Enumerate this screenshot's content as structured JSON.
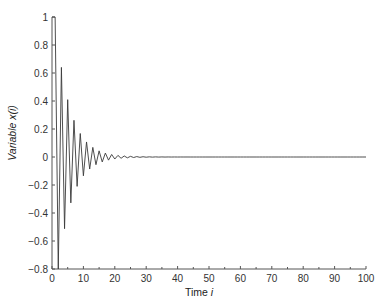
{
  "chart_data": {
    "type": "line",
    "title": "",
    "xlabel": "Time",
    "xlabel_italic": "i",
    "ylabel": "Variable x(",
    "ylabel_italic": "i",
    "ylabel_suffix": ")",
    "xlim": [
      0,
      100
    ],
    "ylim": [
      -0.8,
      1
    ],
    "xticks": [
      0,
      10,
      20,
      30,
      40,
      50,
      60,
      70,
      80,
      90,
      100
    ],
    "xtick_labels": [
      "0",
      "10",
      "20",
      "30",
      "40",
      "50",
      "60",
      "70",
      "80",
      "90",
      "100"
    ],
    "xminor_step": 5,
    "yticks": [
      -0.8,
      -0.6,
      -0.4,
      -0.2,
      0,
      0.2,
      0.4,
      0.6,
      0.8,
      1
    ],
    "ytick_labels": [
      "−0.8",
      "−0.6",
      "−0.4",
      "−0.2",
      "0",
      "0.2",
      "0.4",
      "0.6",
      "0.8",
      "1"
    ],
    "grid": false,
    "legend": "none",
    "series": [
      {
        "name": "x(i)",
        "description": "Damped alternating sequence: x(0)=1, x(i)=(-0.8)^(i-1) for i>=1",
        "x": [
          0,
          1,
          2,
          3,
          4,
          5,
          6,
          7,
          8,
          9,
          10,
          11,
          12,
          13,
          14,
          15,
          16,
          17,
          18,
          19,
          20,
          21,
          22,
          23,
          24,
          25,
          26,
          27,
          28,
          29,
          30,
          31,
          32,
          33,
          34,
          35,
          36,
          37,
          38,
          39,
          40,
          41,
          42,
          43,
          44,
          45,
          46,
          47,
          48,
          49,
          50,
          51,
          52,
          53,
          54,
          55,
          56,
          57,
          58,
          59,
          60,
          61,
          62,
          63,
          64,
          65,
          66,
          67,
          68,
          69,
          70,
          71,
          72,
          73,
          74,
          75,
          76,
          77,
          78,
          79,
          80,
          81,
          82,
          83,
          84,
          85,
          86,
          87,
          88,
          89,
          90,
          91,
          92,
          93,
          94,
          95,
          96,
          97,
          98,
          99,
          100
        ],
        "y": [
          1,
          1,
          -0.8,
          0.64,
          -0.512,
          0.4096,
          -0.3277,
          0.2621,
          -0.2097,
          0.1678,
          -0.1342,
          0.1074,
          -0.0859,
          0.0687,
          -0.055,
          0.044,
          -0.0352,
          0.0281,
          -0.0225,
          0.018,
          -0.0144,
          0.0115,
          -0.0092,
          0.0074,
          -0.0059,
          0.0047,
          -0.0038,
          0.003,
          -0.0024,
          0.0019,
          -0.0015,
          0.0012,
          -0.001,
          0.0008,
          -0.0006,
          0.0005,
          -0.0004,
          0.0003,
          -0.0003,
          0.0002,
          -0.0002,
          0.0001,
          -0.0001,
          0.0001,
          -0.0001,
          0,
          0,
          0,
          0,
          0,
          0,
          0,
          0,
          0,
          0,
          0,
          0,
          0,
          0,
          0,
          0,
          0,
          0,
          0,
          0,
          0,
          0,
          0,
          0,
          0,
          0,
          0,
          0,
          0,
          0,
          0,
          0,
          0,
          0,
          0,
          0,
          0,
          0,
          0,
          0,
          0,
          0,
          0,
          0,
          0,
          0,
          0,
          0,
          0,
          0,
          0,
          0,
          0,
          0,
          0,
          0
        ]
      }
    ]
  }
}
